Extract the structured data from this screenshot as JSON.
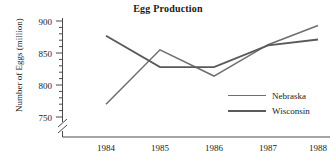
{
  "chart_data": {
    "type": "line",
    "title": "Egg Production",
    "xlabel": "",
    "ylabel": "Number of Eggs (million)",
    "x": [
      "1984",
      "1985",
      "1986",
      "1987",
      "1988"
    ],
    "categories": [
      "1984",
      "1985",
      "1986",
      "1987",
      "1988"
    ],
    "series": [
      {
        "name": "Nebraska",
        "values": [
          770,
          855,
          814,
          863,
          893
        ],
        "color": "#6e6e6e"
      },
      {
        "name": "Wisconsin",
        "values": [
          877,
          828,
          828,
          862,
          871
        ],
        "color": "#5a5a5a"
      }
    ],
    "ylim": [
      750,
      900
    ],
    "y_ticks": [
      750,
      800,
      850,
      900
    ],
    "y_tick_labels": [
      "750",
      "800",
      "850",
      "900"
    ],
    "y_minor_tick_step": 10,
    "y_axis_break": true,
    "grid": false,
    "legend_position": "center-right",
    "legend_entries": [
      "Nebraska",
      "Wisconsin"
    ]
  },
  "axes": {
    "y_labels": [
      "900",
      "850",
      "800",
      "750"
    ],
    "x_labels": [
      "1984",
      "1985",
      "1986",
      "1987",
      "1988"
    ]
  },
  "legend": {
    "items": [
      {
        "label": "Nebraska"
      },
      {
        "label": "Wisconsin"
      }
    ]
  }
}
